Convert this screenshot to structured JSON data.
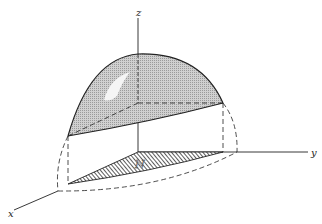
{
  "figure": {
    "type": "3d-surface-projection-diagram",
    "axes": {
      "x_label": "x",
      "y_label": "y",
      "z_label": "z"
    },
    "region_label": "N",
    "colors": {
      "line": "#222222",
      "surface_fill": "#bdbdbd",
      "hatch": "#333333",
      "background": "#ffffff"
    }
  }
}
